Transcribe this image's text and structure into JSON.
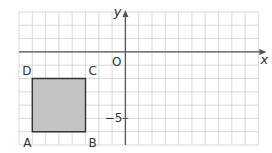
{
  "diagram": {
    "type": "coordinate-grid",
    "x_axis_label": "x",
    "y_axis_label": "y",
    "origin_label": "O",
    "tick_label": "−5",
    "x_range": [
      -8,
      10
    ],
    "y_range": [
      -7,
      3
    ],
    "grid_color": "#cfcfcf",
    "axis_color": "#555555",
    "shape": {
      "name": "square ABCD",
      "fill": "#c4c4c4",
      "stroke": "#333333",
      "vertices": [
        {
          "label": "A",
          "x": -7,
          "y": -6
        },
        {
          "label": "B",
          "x": -3,
          "y": -6
        },
        {
          "label": "C",
          "x": -3,
          "y": -2
        },
        {
          "label": "D",
          "x": -7,
          "y": -2
        }
      ]
    }
  }
}
